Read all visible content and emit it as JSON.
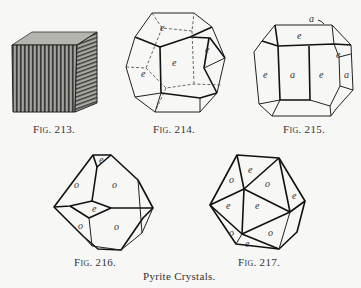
{
  "figures": [
    {
      "id": "fig-213",
      "caption": "Fig. 213.",
      "form": "striated cube",
      "face_labels": []
    },
    {
      "id": "fig-214",
      "caption": "Fig. 214.",
      "form": "pyritohedron",
      "face_labels": [
        "e",
        "e",
        "e",
        "e"
      ]
    },
    {
      "id": "fig-215",
      "caption": "Fig. 215.",
      "form": "cube with pyritohedron",
      "face_labels": [
        "a",
        "e",
        "e",
        "a",
        "e",
        "a",
        "e"
      ]
    },
    {
      "id": "fig-216",
      "caption": "Fig. 216.",
      "form": "octahedron with pyritohedron",
      "face_labels": [
        "e",
        "o",
        "o",
        "e",
        "o",
        "o"
      ]
    },
    {
      "id": "fig-217",
      "caption": "Fig. 217.",
      "form": "octahedron and pyritohedron (icosahedral)",
      "face_labels": [
        "e",
        "o",
        "o",
        "e",
        "e",
        "e",
        "e",
        "o",
        "o",
        "e"
      ]
    }
  ],
  "title": "Pyrite Crystals.",
  "captions": {
    "f213": {
      "prefix": "Fig.",
      "num": "213."
    },
    "f214": {
      "prefix": "Fig.",
      "num": "214."
    },
    "f215": {
      "prefix": "Fig.",
      "num": "215."
    },
    "f216": {
      "prefix": "Fig.",
      "num": "216."
    },
    "f217": {
      "prefix": "Fig.",
      "num": "217."
    }
  },
  "labels": {
    "f214": [
      "e",
      "e",
      "e",
      "e"
    ],
    "f215": [
      "a",
      "e",
      "e",
      "a",
      "e",
      "a",
      "e"
    ],
    "f216": [
      "e",
      "o",
      "o",
      "e",
      "o",
      "o"
    ],
    "f217": [
      "e",
      "o",
      "o",
      "e",
      "e",
      "e",
      "e",
      "o",
      "o",
      "e"
    ]
  }
}
